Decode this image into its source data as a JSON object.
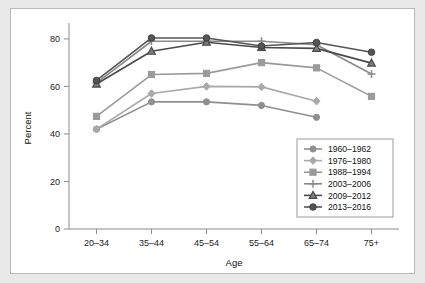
{
  "chart_data": {
    "type": "line",
    "title": "",
    "xlabel": "Age",
    "ylabel": "Percent",
    "categories": [
      "20–34",
      "35–44",
      "45–54",
      "55–64",
      "65–74",
      "75+"
    ],
    "ylim": [
      0,
      85
    ],
    "yticks": [
      0,
      20,
      40,
      60,
      80
    ],
    "ytick_labels": [
      "0",
      "20",
      "40",
      "60",
      "80"
    ],
    "grid": false,
    "legend_position": "lower-right-inside",
    "series": [
      {
        "name": "1960–1962",
        "color": "#8f8f8f",
        "marker": "circle",
        "values": [
          42.0,
          53.5,
          53.5,
          52.0,
          47.0,
          null
        ]
      },
      {
        "name": "1976–1980",
        "color": "#a9a9a9",
        "marker": "diamond",
        "values": [
          42.0,
          57.0,
          60.0,
          59.8,
          53.8,
          null
        ]
      },
      {
        "name": "1988–1994",
        "color": "#9a9a9a",
        "marker": "square",
        "values": [
          47.4,
          65.0,
          65.5,
          70.0,
          67.8,
          55.8
        ]
      },
      {
        "name": "2003–2006",
        "color": "#8a8a8a",
        "marker": "plus",
        "values": [
          61.5,
          79.0,
          79.0,
          79.0,
          77.5,
          65.2
        ]
      },
      {
        "name": "2009–2012",
        "color": "#4a4a4a",
        "marker": "triangle",
        "values": [
          61.0,
          74.8,
          78.6,
          76.4,
          76.0,
          69.8
        ]
      },
      {
        "name": "2013–2016",
        "color": "#555555",
        "marker": "circle-filled",
        "values": [
          62.5,
          80.4,
          80.4,
          77.0,
          78.5,
          74.4
        ]
      }
    ]
  }
}
